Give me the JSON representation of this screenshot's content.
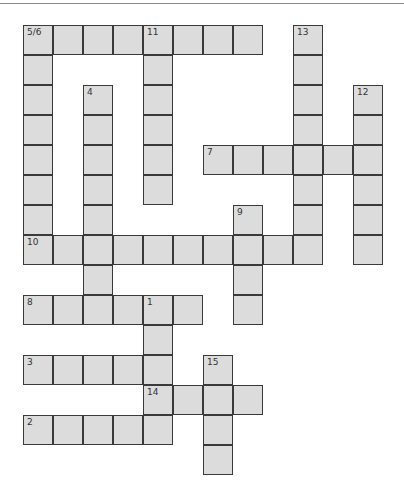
{
  "puzzle": {
    "type": "crossword",
    "cell_size": 30,
    "origin": {
      "x": 23,
      "y": 25
    },
    "colors": {
      "cell_fill": "#dcdcdc",
      "cell_border": "#3a3a3a",
      "number": "#333333"
    },
    "words": [
      {
        "label": "5/6",
        "direction": "across",
        "row": 0,
        "col": 0,
        "length": 8
      },
      {
        "label": "5/6",
        "direction": "down",
        "row": 0,
        "col": 0,
        "length": 8
      },
      {
        "label": "11",
        "direction": "down",
        "row": 0,
        "col": 4,
        "length": 6
      },
      {
        "label": "13",
        "direction": "down",
        "row": 0,
        "col": 9,
        "length": 8
      },
      {
        "label": "4",
        "direction": "down",
        "row": 2,
        "col": 2,
        "length": 7
      },
      {
        "label": "12",
        "direction": "down",
        "row": 2,
        "col": 11,
        "length": 6
      },
      {
        "label": "7",
        "direction": "across",
        "row": 4,
        "col": 6,
        "length": 6
      },
      {
        "label": "9",
        "direction": "down",
        "row": 6,
        "col": 7,
        "length": 4
      },
      {
        "label": "10",
        "direction": "across",
        "row": 7,
        "col": 0,
        "length": 10
      },
      {
        "label": "8",
        "direction": "across",
        "row": 9,
        "col": 0,
        "length": 6
      },
      {
        "label": "1",
        "direction": "down",
        "row": 9,
        "col": 4,
        "length": 5
      },
      {
        "label": "3",
        "direction": "across",
        "row": 11,
        "col": 0,
        "length": 5
      },
      {
        "label": "15",
        "direction": "down",
        "row": 11,
        "col": 6,
        "length": 4
      },
      {
        "label": "14",
        "direction": "across",
        "row": 12,
        "col": 4,
        "length": 4
      },
      {
        "label": "2",
        "direction": "across",
        "row": 13,
        "col": 0,
        "length": 5
      }
    ],
    "numbers": [
      {
        "text": "5/6",
        "row": 0,
        "col": 0
      },
      {
        "text": "11",
        "row": 0,
        "col": 4
      },
      {
        "text": "13",
        "row": 0,
        "col": 9
      },
      {
        "text": "4",
        "row": 2,
        "col": 2
      },
      {
        "text": "12",
        "row": 2,
        "col": 11
      },
      {
        "text": "7",
        "row": 4,
        "col": 6
      },
      {
        "text": "9",
        "row": 6,
        "col": 7
      },
      {
        "text": "10",
        "row": 7,
        "col": 0
      },
      {
        "text": "8",
        "row": 9,
        "col": 0
      },
      {
        "text": "1",
        "row": 9,
        "col": 4
      },
      {
        "text": "3",
        "row": 11,
        "col": 0
      },
      {
        "text": "15",
        "row": 11,
        "col": 6
      },
      {
        "text": "14",
        "row": 12,
        "col": 4
      },
      {
        "text": "2",
        "row": 13,
        "col": 0
      }
    ]
  }
}
